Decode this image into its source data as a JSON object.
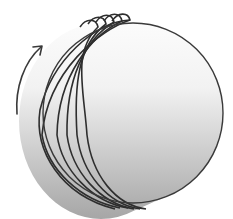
{
  "diagram": {
    "title": "Rotating sphere with successive offset positions",
    "elements": {
      "sphere": {
        "label": "sphere",
        "stroke": "#3a3a3a",
        "fill_top": "#ffffff",
        "fill_bottom": "#a8a8a8"
      },
      "ghost_outlines": {
        "count": 5,
        "stroke": "#2e2e2e"
      },
      "rotation_arrow": {
        "label": "rotation-direction",
        "direction": "counterclockwise-up",
        "stroke": "#3a3a3a"
      }
    }
  }
}
